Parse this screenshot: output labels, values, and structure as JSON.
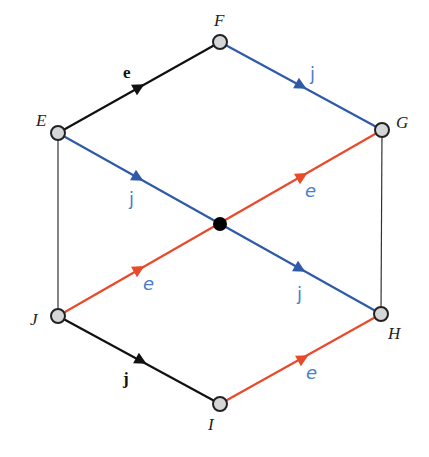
{
  "colors": {
    "black_edge": "#111111",
    "blue_edge": "#2f5aa8",
    "red_edge": "#e84a2a",
    "label_blue": "#4a7fc8",
    "node_fill": "#d4d6d8",
    "node_stroke": "#222222",
    "thin_edge": "#333333"
  },
  "nodes": {
    "E": {
      "label": "E",
      "x": 58,
      "y": 133
    },
    "F": {
      "label": "F",
      "x": 220,
      "y": 42
    },
    "G": {
      "label": "G",
      "x": 382,
      "y": 130
    },
    "H": {
      "label": "H",
      "x": 381,
      "y": 314
    },
    "I": {
      "label": "I",
      "x": 220,
      "y": 404
    },
    "J": {
      "label": "J",
      "x": 58,
      "y": 316
    },
    "center": {
      "x": 220,
      "y": 224
    }
  },
  "edges": [
    {
      "from": "E",
      "to": "F",
      "color": "black",
      "label": "e",
      "style": "bold"
    },
    {
      "from": "F",
      "to": "G",
      "color": "blue",
      "label": "j",
      "style": "color"
    },
    {
      "from": "E",
      "to": "H",
      "color": "blue",
      "label": "j",
      "style": "color",
      "arrows": 2
    },
    {
      "from": "J",
      "to": "G",
      "color": "red",
      "label": "e",
      "style": "color-italic",
      "arrows": 2
    },
    {
      "from": "J",
      "to": "I",
      "color": "black",
      "label": "j",
      "style": "bold"
    },
    {
      "from": "I",
      "to": "H",
      "color": "red",
      "label": "e",
      "style": "color-italic"
    },
    {
      "from": "E",
      "to": "J",
      "color": "thin"
    },
    {
      "from": "G",
      "to": "H",
      "color": "thin"
    }
  ],
  "labels": {
    "node_E": "E",
    "node_F": "F",
    "node_G": "G",
    "node_H": "H",
    "node_I": "I",
    "node_J": "J",
    "edge_EF": "e",
    "edge_FG": "j",
    "edge_EC": "j",
    "edge_CH": "j",
    "edge_JC": "e",
    "edge_CG": "e",
    "edge_JI": "j",
    "edge_IH": "e"
  }
}
